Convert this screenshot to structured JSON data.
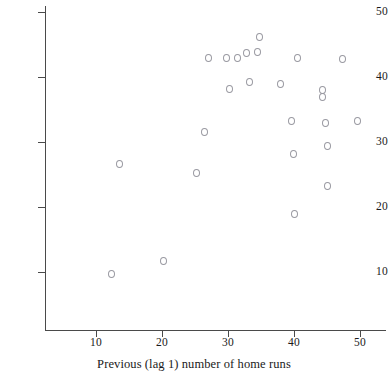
{
  "chart_data": {
    "type": "scatter",
    "title": "",
    "subtitle": "",
    "xlabel": "Previous (lag 1) number of home runs",
    "ylabel": "",
    "xlim": [
      5,
      54
    ],
    "ylim": [
      4,
      52
    ],
    "xticks": [
      10,
      20,
      30,
      40,
      50
    ],
    "yticks": [
      10,
      20,
      30,
      40,
      50
    ],
    "grid": false,
    "legend": null,
    "marker": "open-circle",
    "marker_color": "#9a9aa2",
    "axis_color": "#4a4a4a",
    "x": [
      12.3,
      13.5,
      20.2,
      25.2,
      26.5,
      27.1,
      29.8,
      30.2,
      31.4,
      32.8,
      33.3,
      34.5,
      34.8,
      38.0,
      39.2,
      39.6,
      39.9,
      40.1,
      40.5,
      43.5,
      44.3,
      44.8,
      45.0,
      45.1,
      47.3,
      49.6
    ],
    "y": [
      9.7,
      26.6,
      11.7,
      25.3,
      31.5,
      43.0,
      43.0,
      38.2,
      43.0,
      43.7,
      39.2,
      43.9,
      46.1,
      39.0,
      33.2,
      28.2,
      19.0,
      43.0,
      23.2,
      38.0,
      37.0,
      33.0,
      29.4,
      23.2,
      42.8,
      33.2
    ],
    "points": [
      {
        "x": 12.3,
        "y": 9.7
      },
      {
        "x": 13.5,
        "y": 26.6
      },
      {
        "x": 20.2,
        "y": 11.7
      },
      {
        "x": 25.2,
        "y": 25.3
      },
      {
        "x": 26.5,
        "y": 31.5
      },
      {
        "x": 27.1,
        "y": 43.0
      },
      {
        "x": 29.8,
        "y": 43.0
      },
      {
        "x": 30.2,
        "y": 38.2
      },
      {
        "x": 31.4,
        "y": 43.0
      },
      {
        "x": 32.8,
        "y": 43.7
      },
      {
        "x": 33.3,
        "y": 39.2
      },
      {
        "x": 34.5,
        "y": 43.9
      },
      {
        "x": 34.8,
        "y": 46.1
      },
      {
        "x": 38.0,
        "y": 39.0
      },
      {
        "x": 39.6,
        "y": 33.2
      },
      {
        "x": 39.9,
        "y": 28.2
      },
      {
        "x": 40.1,
        "y": 19.0
      },
      {
        "x": 40.5,
        "y": 43.0
      },
      {
        "x": 44.3,
        "y": 38.0
      },
      {
        "x": 44.3,
        "y": 37.0
      },
      {
        "x": 44.8,
        "y": 33.0
      },
      {
        "x": 45.0,
        "y": 29.4
      },
      {
        "x": 45.1,
        "y": 23.2
      },
      {
        "x": 47.3,
        "y": 42.8
      },
      {
        "x": 49.6,
        "y": 33.2
      }
    ],
    "n_points": 25
  },
  "axes": {
    "x_title": "Previous (lag 1) number of home runs",
    "x_tick_labels": [
      "10",
      "20",
      "30",
      "40",
      "50"
    ],
    "y_tick_labels": [
      "10",
      "20",
      "30",
      "40",
      "50"
    ]
  }
}
